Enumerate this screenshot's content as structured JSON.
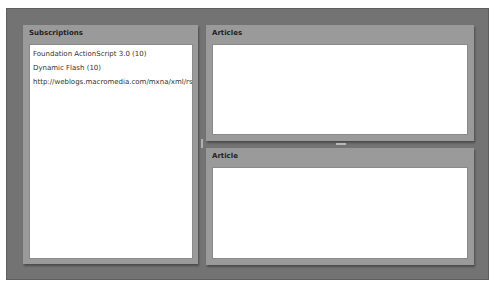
{
  "panels": {
    "subscriptions": {
      "title": "Subscriptions",
      "items": [
        {
          "label": "Foundation ActionScript 3.0 (10)"
        },
        {
          "label": "Dynamic Flash (10)"
        },
        {
          "label": "http://weblogs.macromedia.com/mxna/xml/rss"
        }
      ]
    },
    "articles": {
      "title": "Articles"
    },
    "article": {
      "title": "Article"
    }
  },
  "colors": {
    "frame": "#737373",
    "panel": "#9a9a9a",
    "content": "#ffffff"
  }
}
